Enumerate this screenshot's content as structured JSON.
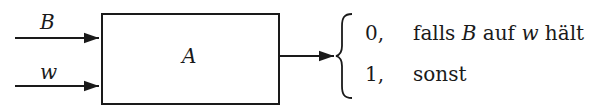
{
  "diagram": {
    "inputs": [
      {
        "label": "B",
        "y": 38
      },
      {
        "label": "w",
        "y": 86
      }
    ],
    "box": {
      "label": "A"
    },
    "output": {
      "cases": [
        {
          "value": "0,",
          "condition_parts": [
            "falls ",
            "B",
            " auf ",
            "w",
            " hält"
          ]
        },
        {
          "value": "1,",
          "condition_parts": [
            "sonst"
          ]
        }
      ]
    },
    "colors": {
      "stroke": "#1a1a1a",
      "background": "#ffffff"
    }
  }
}
